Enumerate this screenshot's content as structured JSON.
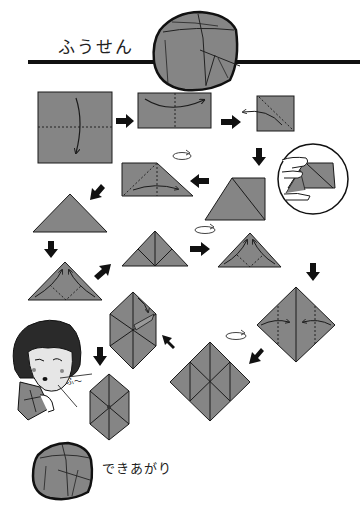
{
  "title": "ふうせん",
  "colors": {
    "paper": "#858585",
    "outline": "#1a1a1a",
    "background": "#ffffff",
    "skin": "#e6e6e6",
    "hair": "#2a2a2a"
  },
  "sound_effect": "ふ〜",
  "finished_label": "できあがり",
  "steps": [
    {
      "id": 1,
      "shape": "square",
      "action": "fold top down along horizontal center (valley fold)"
    },
    {
      "id": 2,
      "shape": "rectangle",
      "action": "fold left over right along vertical center"
    },
    {
      "id": 3,
      "shape": "small-square",
      "action": "open and squash fold along diagonal"
    },
    {
      "id": 4,
      "shape": "triangle-with-square",
      "action": "squash fold (see inset with hands)"
    },
    {
      "id": 5,
      "shape": "trapezoid",
      "action": "turn over and fold"
    },
    {
      "id": 6,
      "shape": "triangle",
      "action": "waterbomb base"
    },
    {
      "id": 7,
      "shape": "triangle",
      "action": "fold bottom corners up to top"
    },
    {
      "id": 8,
      "shape": "triangle",
      "action": "result, turn over"
    },
    {
      "id": 9,
      "shape": "triangle",
      "action": "fold bottom corners up to top"
    },
    {
      "id": 10,
      "shape": "diamond",
      "action": "fold side corners to center"
    },
    {
      "id": 11,
      "shape": "diamond",
      "action": "turn over and repeat"
    },
    {
      "id": 12,
      "shape": "hexagon",
      "action": "tuck flaps into pockets"
    },
    {
      "id": 13,
      "shape": "hexagon",
      "action": "blow into the hole to inflate"
    }
  ],
  "icons": [
    "arrow-right-icon",
    "arrow-down-icon",
    "arrow-left-icon",
    "arrow-diagonal-icon",
    "turn-over-icon",
    "fold-arrow-icon"
  ]
}
